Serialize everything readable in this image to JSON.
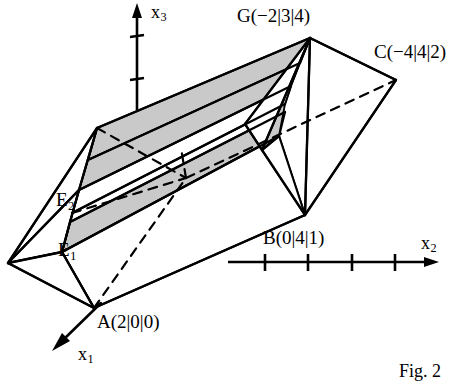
{
  "figure": {
    "caption": "Fig. 2",
    "colors": {
      "stroke": "#000000",
      "shade_fill": "#c9c9c9",
      "white_fill": "#ffffff",
      "background": "#ffffff"
    },
    "axes": [
      {
        "name": "x1",
        "label": "x",
        "subscript": "1",
        "x": 78,
        "y": 345
      },
      {
        "name": "x2",
        "label": "x",
        "subscript": "2",
        "x": 421,
        "y": 234
      },
      {
        "name": "x3",
        "label": "x",
        "subscript": "3",
        "x": 151,
        "y": 3
      }
    ],
    "axis_ticks": {
      "x2_count": 4,
      "x3_count": 2
    },
    "points": [
      {
        "name": "A",
        "label": "A(2|0|0)",
        "x": 97,
        "y": 312
      },
      {
        "name": "B",
        "label": "B(0|4|1)",
        "x": 263,
        "y": 228
      },
      {
        "name": "C",
        "label": "C(−4|4|2)",
        "x": 374,
        "y": 42
      },
      {
        "name": "G",
        "label": "G(−2|3|4)",
        "x": 237,
        "y": 6
      }
    ],
    "planes": [
      {
        "name": "E1",
        "label": "E",
        "subscript": "1",
        "x": 58,
        "y": 240
      },
      {
        "name": "E2",
        "label": "E",
        "subscript": "2",
        "x": 56,
        "y": 190
      }
    ]
  }
}
